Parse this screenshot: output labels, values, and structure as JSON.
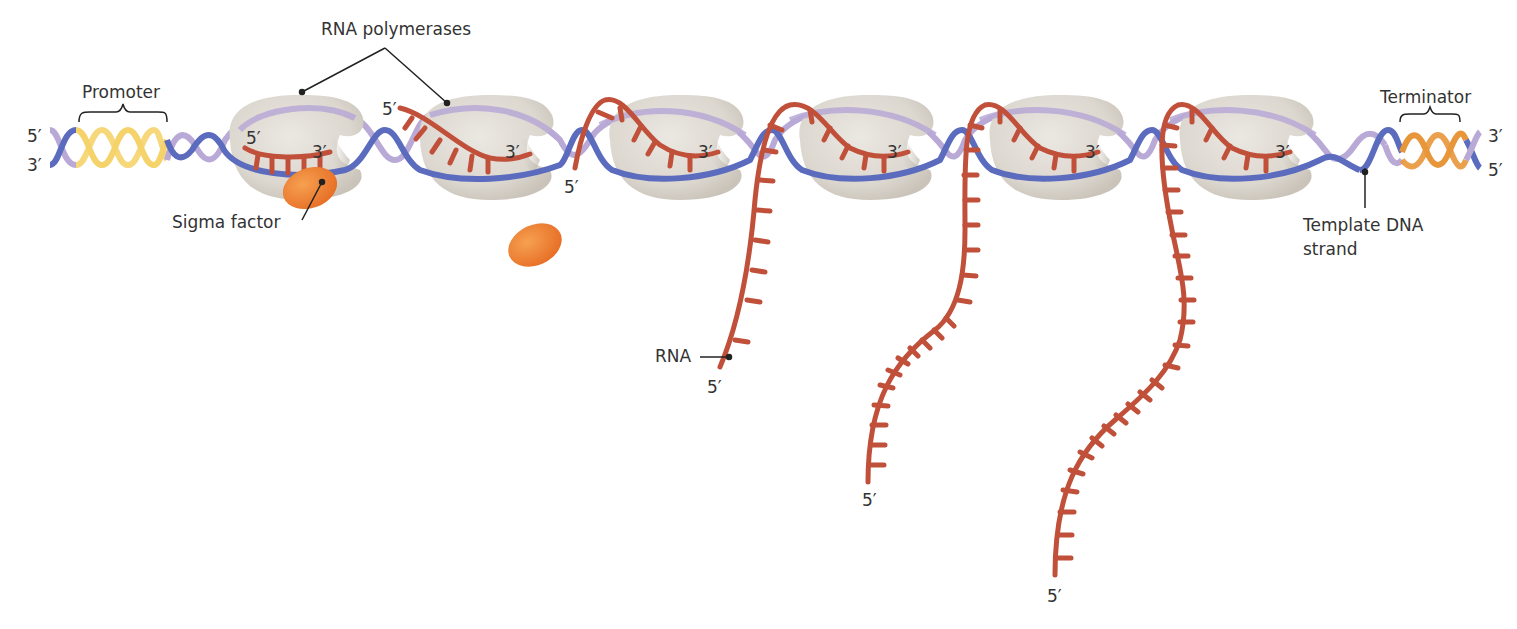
{
  "figure": {
    "colors": {
      "template_strand": "#5b6bbd",
      "coding_strand": "#b8a9d6",
      "promoter": "#f5d36a",
      "terminator": "#e8963a",
      "rna": "#c0503a",
      "polymerase": "#dedad3",
      "sigma_factor": "#ef7f33"
    }
  },
  "labels": {
    "rna_polymerases": "RNA polymerases",
    "promoter": "Promoter",
    "terminator": "Terminator",
    "sigma_factor": "Sigma factor",
    "template_dna": "Template DNA\nstrand",
    "template_dna_line1": "Template DNA",
    "template_dna_line2": "strand",
    "rna": "RNA"
  },
  "ends": {
    "dna_left_top": "5′",
    "dna_left_bottom": "3′",
    "dna_right_top": "3′",
    "dna_right_bottom": "5′",
    "pol1_rna_5": "5′",
    "pol1_rna_3": "3′",
    "pol2_rna_5": "5′",
    "pol2_rna_3": "3′",
    "pol3_rna_5": "5′",
    "pol3_rna_3": "3′",
    "pol4_rna_3": "3′",
    "pol5_rna_3": "3′",
    "pol6_rna_3": "3′",
    "rna1_5": "5′",
    "rna2_5": "5′",
    "rna3_5": "5′"
  },
  "polymerases": [
    {
      "id": 1,
      "cx": 295,
      "cy": 155,
      "has_sigma": true
    },
    {
      "id": 2,
      "cx": 485,
      "cy": 155,
      "has_sigma": false
    },
    {
      "id": 3,
      "cx": 675,
      "cy": 155,
      "has_sigma": false
    },
    {
      "id": 4,
      "cx": 870,
      "cy": 155,
      "has_sigma": false
    },
    {
      "id": 5,
      "cx": 1060,
      "cy": 155,
      "has_sigma": false
    },
    {
      "id": 6,
      "cx": 1250,
      "cy": 155,
      "has_sigma": false
    }
  ]
}
